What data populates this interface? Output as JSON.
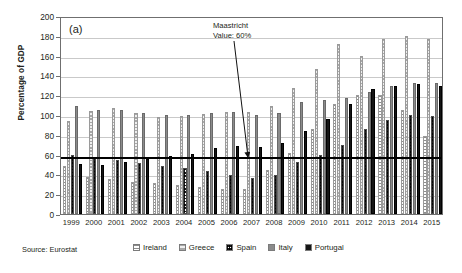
{
  "figure": {
    "panel_letter": "(a)",
    "source": "Source: Eurostat",
    "annotation_line1": "Maastricht",
    "annotation_line2": "Value: 60%"
  },
  "chart_data": {
    "type": "bar",
    "title": "",
    "xlabel": "",
    "ylabel": "Percentage of GDP",
    "ylim": [
      0,
      200
    ],
    "ytick_step": 20,
    "yticks": [
      0,
      20,
      40,
      60,
      80,
      100,
      120,
      140,
      160,
      180,
      200
    ],
    "grid": true,
    "legend_position": "bottom",
    "reference_line": {
      "label": "Maastricht Value: 60%",
      "value": 60,
      "color": "#000000"
    },
    "categories": [
      "1999",
      "2000",
      "2001",
      "2002",
      "2003",
      "2004",
      "2005",
      "2006",
      "2007",
      "2008",
      "2009",
      "2010",
      "2011",
      "2012",
      "2013",
      "2014",
      "2015"
    ],
    "series": [
      {
        "name": "Ireland",
        "color": "#ffffff",
        "pattern": "dotted-light",
        "values": [
          48,
          37,
          35,
          32,
          31,
          29,
          27,
          25,
          25,
          44,
          62,
          86,
          111,
          120,
          120,
          105,
          79
        ]
      },
      {
        "name": "Greece",
        "color": "#d8d8d8",
        "pattern": "light-dashed",
        "values": [
          94,
          104,
          107,
          102,
          98,
          99,
          101,
          103,
          103,
          109,
          127,
          146,
          172,
          160,
          177,
          180,
          177
        ]
      },
      {
        "name": "Spain",
        "color": "#ffffff",
        "pattern": "checkered",
        "values": [
          60,
          58,
          55,
          52,
          48,
          46,
          43,
          39,
          36,
          39,
          53,
          60,
          70,
          86,
          95,
          100,
          99
        ]
      },
      {
        "name": "Italy",
        "color": "#8b8b8b",
        "pattern": "solid-gray",
        "values": [
          109,
          105,
          105,
          102,
          100,
          100,
          102,
          103,
          100,
          102,
          113,
          115,
          117,
          123,
          129,
          132,
          132
        ]
      },
      {
        "name": "Portugal",
        "color": "#151515",
        "pattern": "solid-black",
        "values": [
          51,
          50,
          53,
          56,
          59,
          61,
          67,
          69,
          68,
          72,
          84,
          96,
          111,
          126,
          129,
          131,
          129
        ]
      }
    ]
  },
  "legend": {
    "items": [
      {
        "label": "Ireland"
      },
      {
        "label": "Greece"
      },
      {
        "label": "Spain"
      },
      {
        "label": "Italy"
      },
      {
        "label": "Portugal"
      }
    ]
  }
}
